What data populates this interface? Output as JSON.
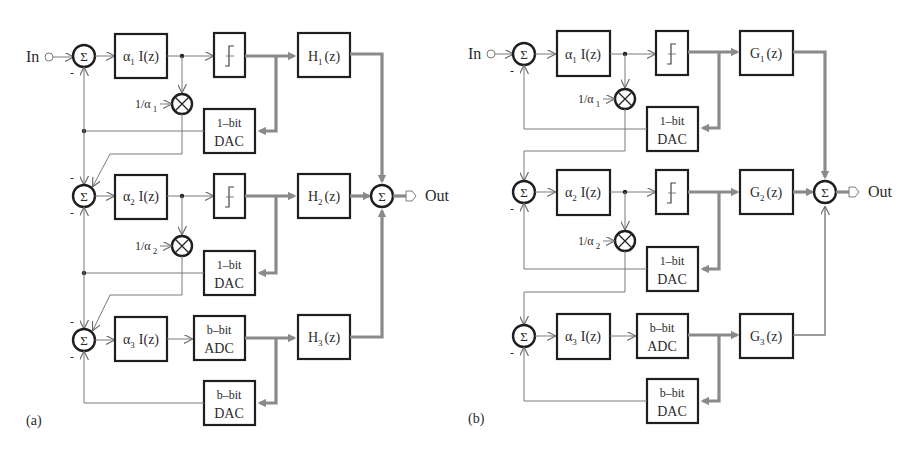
{
  "diagram_a": {
    "panel_label": "(a)",
    "input_label": "In",
    "output_label": "Out",
    "sum_symbol": "Σ",
    "minus_sign": "-",
    "stages": [
      {
        "alpha": "α",
        "alpha_sub": "1",
        "integrator": "I(z)",
        "quantizer": "1-bit-quantizer",
        "dac_top": "1–bit",
        "dac_bottom": "DAC",
        "filter_name": "H",
        "filter_sub": "1",
        "filter_arg": "(z)",
        "scale_num": "1/α",
        "scale_sub": "1"
      },
      {
        "alpha": "α",
        "alpha_sub": "2",
        "integrator": "I(z)",
        "quantizer": "1-bit-quantizer",
        "dac_top": "1–bit",
        "dac_bottom": "DAC",
        "filter_name": "H",
        "filter_sub": "2",
        "filter_arg": "(z)",
        "scale_num": "1/α",
        "scale_sub": "2"
      },
      {
        "alpha": "α",
        "alpha_sub": "3",
        "integrator": "I(z)",
        "adc_top": "b–bit",
        "adc_bottom": "ADC",
        "dac_top": "b–bit",
        "dac_bottom": "DAC",
        "filter_name": "H",
        "filter_sub": "3",
        "filter_arg": "(z)"
      }
    ]
  },
  "diagram_b": {
    "panel_label": "(b)",
    "input_label": "In",
    "output_label": "Out",
    "sum_symbol": "Σ",
    "minus_sign": "-",
    "stages": [
      {
        "alpha": "α",
        "alpha_sub": "1",
        "integrator": "I(z)",
        "quantizer": "1-bit-quantizer",
        "dac_top": "1–bit",
        "dac_bottom": "DAC",
        "filter_name": "G",
        "filter_sub": "1",
        "filter_arg": "(z)",
        "scale_num": "1/α",
        "scale_sub": "1"
      },
      {
        "alpha": "α",
        "alpha_sub": "2",
        "integrator": "I(z)",
        "quantizer": "1-bit-quantizer",
        "dac_top": "1–bit",
        "dac_bottom": "DAC",
        "filter_name": "G",
        "filter_sub": "2",
        "filter_arg": "(z)",
        "scale_num": "1/α",
        "scale_sub": "2"
      },
      {
        "alpha": "α",
        "alpha_sub": "3",
        "integrator": "I(z)",
        "adc_top": "b–bit",
        "adc_bottom": "ADC",
        "dac_top": "b–bit",
        "dac_bottom": "DAC",
        "filter_name": "G",
        "filter_sub": "3",
        "filter_arg": "(z)"
      }
    ]
  },
  "colors": {
    "thin_line": "#7a7a7a",
    "thick_line": "#8a8a8a",
    "box_stroke": "#1e1e1e",
    "text": "#2a2a2a",
    "background": "#ffffff"
  }
}
